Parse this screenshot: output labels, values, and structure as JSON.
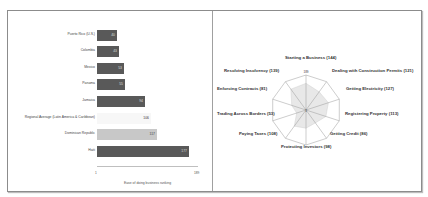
{
  "chart_data": [
    {
      "type": "bar",
      "orientation": "horizontal",
      "title": "",
      "xlabel": "Ease of doing business ranking",
      "ylabel": "",
      "xlim": [
        1,
        189
      ],
      "x_ticks": [
        "1",
        "189"
      ],
      "grid": false,
      "categories": [
        "Puerto Rico (U.S.)",
        "Colombia",
        "Mexico",
        "Panama",
        "Jamaica",
        "Regional Average (Latin America & Caribbean)",
        "Dominican Republic",
        "Haiti"
      ],
      "values": [
        40,
        43,
        53,
        55,
        94,
        106,
        117,
        177
      ],
      "value_labels": [
        "40",
        "43",
        "53",
        "55",
        "94",
        "106",
        "117",
        "177"
      ],
      "bar_colors": [
        "#595959",
        "#595959",
        "#595959",
        "#595959",
        "#595959",
        "#f7f7f7",
        "#c8c8c8",
        "#595959"
      ]
    },
    {
      "type": "radar",
      "title": "",
      "axis_max": 189,
      "center_label": "1",
      "outer_label": "189",
      "axes": [
        "Starting a Business",
        "Dealing with Construction Permits",
        "Getting Electricity",
        "Registering Property",
        "Getting Credit",
        "Protecting Investors",
        "Paying Taxes",
        "Trading Across Borders",
        "Enforcing Contracts",
        "Resolving Insolvency"
      ],
      "values": [
        144,
        121,
        127,
        113,
        86,
        98,
        108,
        53,
        81,
        139
      ],
      "labels": [
        "Starting a Business (144)",
        "Dealing with Construction Permits (121)",
        "Getting Electricity (127)",
        "Registering Property (113)",
        "Getting Credit (86)",
        "Protecting Investors (98)",
        "Paying Taxes (108)",
        "Trading Across Borders (53)",
        "Enforcing Contracts (81)",
        "Resolving Insolvency (139)"
      ]
    }
  ],
  "colors": {
    "dark_bar": "#595959",
    "light_bar": "#c8c8c8",
    "average_bar": "#f7f7f7",
    "radar_fill": "#e6e6e6",
    "grid_line": "#9a9a9a"
  }
}
